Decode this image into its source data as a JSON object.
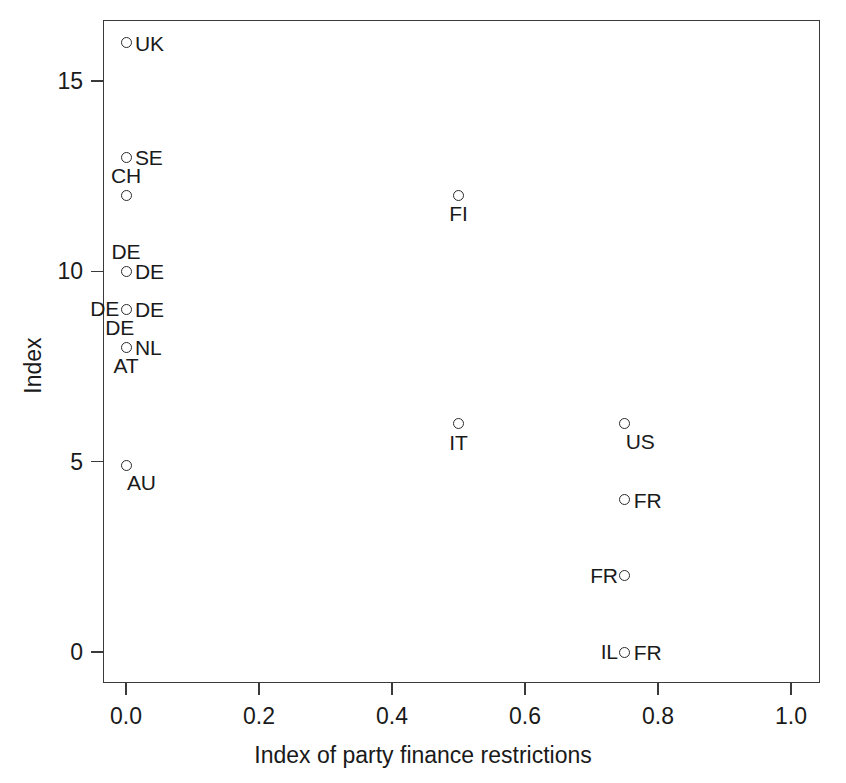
{
  "chart_data": {
    "type": "scatter",
    "title": "",
    "xlabel": "Index of party finance restrictions",
    "ylabel": "Index",
    "xlim": [
      -0.04,
      1.045
    ],
    "ylim": [
      -0.6,
      16.8
    ],
    "xticks": [
      "0.0",
      "0.2",
      "0.4",
      "0.6",
      "0.8",
      "1.0"
    ],
    "xtick_values": [
      0.0,
      0.2,
      0.4,
      0.6,
      0.8,
      1.0
    ],
    "yticks": [
      "0",
      "5",
      "10",
      "15"
    ],
    "ytick_values": [
      0,
      5,
      10,
      15
    ],
    "grid": false,
    "legend": null,
    "marker": "open-circle",
    "points": [
      {
        "label": "UK",
        "x": 0.0,
        "y": 16.0,
        "label_pos": "right"
      },
      {
        "label": "SE",
        "x": 0.0,
        "y": 13.0,
        "label_pos": "right"
      },
      {
        "label": "CH",
        "x": 0.0,
        "y": 12.0,
        "label_pos": "above"
      },
      {
        "label": "DE",
        "x": 0.0,
        "y": 10.0,
        "label_pos": "above"
      },
      {
        "label": "DE",
        "x": 0.0,
        "y": 10.0,
        "label_pos": "right"
      },
      {
        "label": "DE",
        "x": 0.0,
        "y": 9.0,
        "label_pos": "left"
      },
      {
        "label": "DE",
        "x": 0.0,
        "y": 9.0,
        "label_pos": "right"
      },
      {
        "label": "DE",
        "x": 0.0,
        "y": 8.0,
        "label_pos": "above-left"
      },
      {
        "label": "NL",
        "x": 0.0,
        "y": 8.0,
        "label_pos": "right"
      },
      {
        "label": "AT",
        "x": 0.0,
        "y": 8.0,
        "label_pos": "below"
      },
      {
        "label": "AU",
        "x": 0.0,
        "y": 4.9,
        "label_pos": "below-right"
      },
      {
        "label": "FI",
        "x": 0.5,
        "y": 12.0,
        "label_pos": "below"
      },
      {
        "label": "IT",
        "x": 0.5,
        "y": 6.0,
        "label_pos": "below"
      },
      {
        "label": "US",
        "x": 0.75,
        "y": 6.0,
        "label_pos": "below-right"
      },
      {
        "label": "FR",
        "x": 0.75,
        "y": 4.0,
        "label_pos": "right"
      },
      {
        "label": "FR",
        "x": 0.75,
        "y": 2.0,
        "label_pos": "left"
      },
      {
        "label": "IL",
        "x": 0.75,
        "y": 0.0,
        "label_pos": "left"
      },
      {
        "label": "FR",
        "x": 0.75,
        "y": 0.0,
        "label_pos": "right"
      }
    ]
  },
  "colors": {
    "marker_stroke": "#2b2b2b",
    "axis": "#3a3a3a",
    "text": "#1a1a1a",
    "background": "#ffffff"
  }
}
